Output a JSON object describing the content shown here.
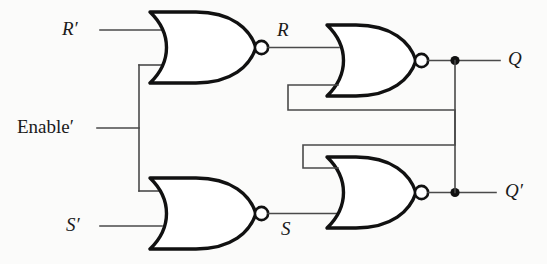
{
  "diagram": {
    "type": "logic-circuit",
    "background_color": "#fbfbfa",
    "wire_color": "#4a4a4a",
    "gate_outline_color": "#111111"
  },
  "labels": {
    "input_r_bar": "R′",
    "input_enable_bar": "Enable′",
    "input_s_bar": "S′",
    "internal_r": "R",
    "internal_s": "S",
    "output_q": "Q",
    "output_q_bar": "Q′"
  },
  "gates": [
    {
      "id": "nor-gate-top-left",
      "type": "NOR",
      "inputs": [
        "R′",
        "Enable′"
      ],
      "output": "R"
    },
    {
      "id": "nor-gate-bottom-left",
      "type": "NOR",
      "inputs": [
        "Enable′",
        "S′"
      ],
      "output": "S"
    },
    {
      "id": "nor-gate-top-right",
      "type": "NOR",
      "inputs": [
        "R",
        "Q′"
      ],
      "output": "Q"
    },
    {
      "id": "nor-gate-bottom-right",
      "type": "NOR",
      "inputs": [
        "Q",
        "S"
      ],
      "output": "Q′"
    }
  ],
  "junctions": [
    {
      "id": "enable-fanout",
      "x": 139,
      "y": 128
    },
    {
      "id": "q-fanout",
      "x": 455,
      "y": 64
    },
    {
      "id": "q-bar-fanout",
      "x": 455,
      "y": 192
    }
  ]
}
